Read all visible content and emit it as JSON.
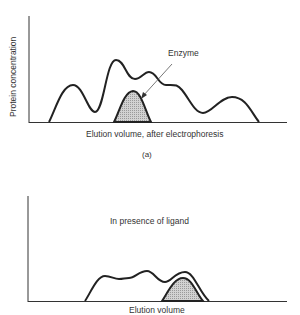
{
  "panel_a": {
    "y_axis_label": "Protein concentration",
    "x_axis_label": "Elution volume, after electrophoresis",
    "annotation": "Enzyme",
    "caption": "(a)"
  },
  "panel_b": {
    "annotation": "In presence of ligand",
    "x_axis_label": "Elution volume"
  },
  "colors": {
    "line": "#222222",
    "enzyme_fill": "#c8c8c8",
    "axis": "#333333"
  }
}
